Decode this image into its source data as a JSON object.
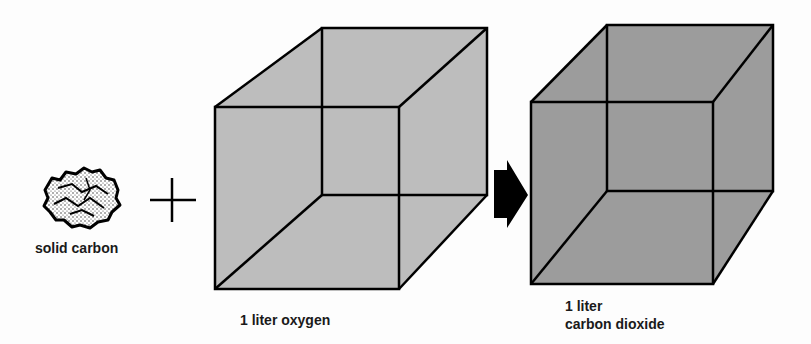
{
  "diagram": {
    "reactant_solid": {
      "label": "solid carbon"
    },
    "plus_sign": "+",
    "reactant_gas": {
      "label": "1 liter oxygen",
      "fill": "#bdbdbd"
    },
    "arrow": {
      "direction": "right",
      "color": "#000000"
    },
    "product_gas": {
      "label_line1": "1 liter",
      "label_line2": "carbon dioxide",
      "fill": "#9c9c9c"
    }
  }
}
